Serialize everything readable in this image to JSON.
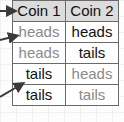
{
  "table": {
    "headers": [
      "Coin 1",
      "Coin 2"
    ],
    "rows": [
      {
        "cells": [
          "heads",
          "heads"
        ],
        "dim": [
          true,
          false
        ]
      },
      {
        "cells": [
          "heads",
          "tails"
        ],
        "dim": [
          true,
          false
        ]
      },
      {
        "cells": [
          "tails",
          "heads"
        ],
        "dim": [
          false,
          true
        ]
      },
      {
        "cells": [
          "tails",
          "tails"
        ],
        "dim": [
          false,
          true
        ]
      }
    ]
  },
  "arrows": [
    {
      "name": "arrow-to-header",
      "points_to": "Coin 1"
    },
    {
      "name": "arrow-to-row-1",
      "points_to": "heads"
    },
    {
      "name": "arrow-to-row-3",
      "points_to": "tails"
    }
  ],
  "colors": {
    "header_bg": "#dcdcdc",
    "text": "#111111",
    "dim_text": "#8a8a8a",
    "border": "#6a6a6a",
    "arrow": "#3a3a3a"
  }
}
